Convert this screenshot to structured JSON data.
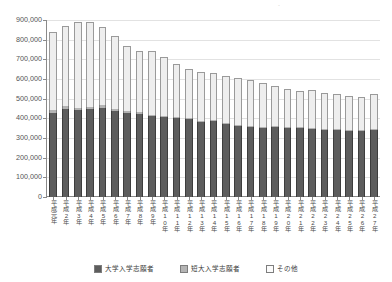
{
  "chart_data": {
    "type": "bar",
    "stacked": true,
    "title": "",
    "xlabel": "",
    "ylabel": "",
    "ylim": [
      0,
      900000
    ],
    "ytick_step": 100000,
    "ytick_labels": [
      "0",
      "100,000",
      "200,000",
      "300,000",
      "400,000",
      "500,000",
      "600,000",
      "700,000",
      "800,000",
      "900,000"
    ],
    "ytick_values": [
      0,
      100000,
      200000,
      300000,
      400000,
      500000,
      600000,
      700000,
      800000,
      900000
    ],
    "grid": true,
    "legend_position": "bottom",
    "categories": [
      "平成元年",
      "平成2年",
      "平成3年",
      "平成4年",
      "平成5年",
      "平成6年",
      "平成7年",
      "平成8年",
      "平成9年",
      "平成10年",
      "平成11年",
      "平成12年",
      "平成13年",
      "平成14年",
      "平成15年",
      "平成16年",
      "平成17年",
      "平成18年",
      "平成19年",
      "平成20年",
      "平成21年",
      "平成22年",
      "平成23年",
      "平成24年",
      "平成25年",
      "平成26年",
      "平成27年"
    ],
    "series": [
      {
        "name": "大学入学志願者",
        "color": "#5d5d5d",
        "values": [
          425000,
          450000,
          440000,
          445000,
          455000,
          435000,
          425000,
          420000,
          410000,
          405000,
          400000,
          395000,
          382000,
          385000,
          372000,
          360000,
          355000,
          352000,
          356000,
          350000,
          352000,
          348000,
          342000,
          340000,
          338000,
          335000,
          340000
        ]
      },
      {
        "name": "短大入学志願者",
        "color": "#b4b4b4",
        "values": [
          16000,
          14000,
          15000,
          14000,
          13000,
          12000,
          11000,
          10000,
          9000,
          8000,
          7000,
          6500,
          6000,
          6000,
          5500,
          5000,
          5000,
          5000,
          5000,
          4500,
          4500,
          4500,
          4000,
          4000,
          4000,
          4000,
          4000
        ]
      },
      {
        "name": "その他",
        "color": "#eeeeee",
        "values": [
          400000,
          408000,
          435000,
          431000,
          397000,
          373000,
          334000,
          312000,
          324000,
          301000,
          268000,
          252000,
          250000,
          239000,
          237000,
          238000,
          234000,
          225000,
          203000,
          194000,
          184000,
          190000,
          180000,
          178000,
          172000,
          168000,
          178000
        ]
      }
    ],
    "totals": [
      841000,
      872000,
      890000,
      890000,
      865000,
      820000,
      770000,
      742000,
      743000,
      714000,
      675000,
      653500,
      638000,
      630000,
      614500,
      603000,
      594000,
      582000,
      564000,
      548500,
      540500,
      542500,
      526000,
      522000,
      514000,
      507000,
      522000
    ]
  },
  "legend": {
    "items": [
      {
        "label": "大学入学志願者",
        "swatch": "univ"
      },
      {
        "label": "短大入学志願者",
        "swatch": "junior"
      },
      {
        "label": "その他",
        "swatch": "other"
      }
    ]
  },
  "colors": {
    "univ": "#5d5d5d",
    "junior": "#b4b4b4",
    "other": "#eeeeee",
    "axis": "#8a8a8a",
    "grid": "#e2e2e2",
    "text": "#4a4a4a"
  }
}
